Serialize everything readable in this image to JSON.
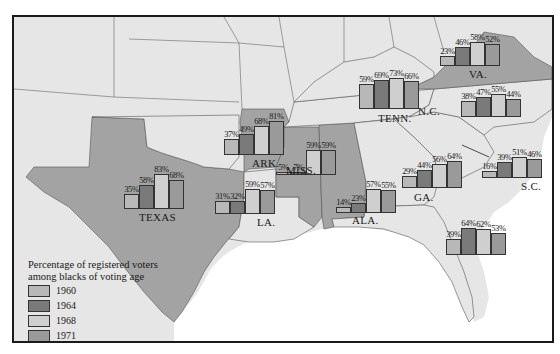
{
  "colors": {
    "y1960": "#b8b8b8",
    "y1964": "#7a7a7a",
    "y1968": "#cfcfcf",
    "y1971": "#9a9a9a",
    "poll_tax_state": "#a3a3a3",
    "other_state": "#e6e6e6",
    "water": "#ffffff"
  },
  "legend": {
    "title_line1": "Percentage of registered voters",
    "title_line2": "among blacks of voting age",
    "items": [
      {
        "label": "1960",
        "key": "y1960"
      },
      {
        "label": "1964",
        "key": "y1964"
      },
      {
        "label": "1968",
        "key": "y1968"
      },
      {
        "label": "1971",
        "key": "y1971"
      },
      {
        "label": "States using local poll tax to discriminate against black voters until 1965",
        "key": "poll_tax_state"
      }
    ]
  },
  "chart_data": {
    "type": "bar",
    "title": "Percentage of registered voters among blacks of voting age",
    "series_names": [
      "1960",
      "1964",
      "1968",
      "1971"
    ],
    "states": [
      {
        "name": "TEXAS",
        "values": [
          35,
          58,
          83,
          68
        ],
        "poll_tax": true
      },
      {
        "name": "ARK.",
        "values": [
          37,
          49,
          68,
          81
        ],
        "poll_tax": true
      },
      {
        "name": "LA.",
        "values": [
          31,
          32,
          59,
          57
        ],
        "poll_tax": false
      },
      {
        "name": "MISS.",
        "values": [
          5,
          7,
          59,
          59
        ],
        "poll_tax": true
      },
      {
        "name": "ALA.",
        "values": [
          14,
          23,
          57,
          55
        ],
        "poll_tax": true
      },
      {
        "name": "TENN.",
        "values": [
          59,
          69,
          73,
          66
        ],
        "poll_tax": false
      },
      {
        "name": "GA.",
        "values": [
          29,
          44,
          56,
          64
        ],
        "poll_tax": false
      },
      {
        "name": "S.C.",
        "values": [
          16,
          39,
          51,
          46
        ],
        "poll_tax": false
      },
      {
        "name": "N.C.",
        "values": [
          38,
          47,
          55,
          44
        ],
        "poll_tax": false
      },
      {
        "name": "VA.",
        "values": [
          23,
          46,
          58,
          52
        ],
        "poll_tax": true
      },
      {
        "name": "FLA.",
        "values": [
          39,
          64,
          62,
          53
        ],
        "poll_tax": false
      }
    ],
    "ylim": [
      0,
      100
    ],
    "legend_position": "bottom-left"
  },
  "layout": {
    "bar_width": 15,
    "px_per_pct": 0.42,
    "groups": [
      {
        "state": "TEXAS",
        "x": 110,
        "base_y": 192,
        "label_x": 125,
        "label_y": 194
      },
      {
        "state": "ARK.",
        "x": 210,
        "base_y": 138,
        "label_x": 238,
        "label_y": 140
      },
      {
        "state": "LA.",
        "x": 201,
        "base_y": 197,
        "label_x": 243,
        "label_y": 199
      },
      {
        "state": "MISS.",
        "x": 262,
        "base_y": 158,
        "label_x": 272,
        "label_y": 147
      },
      {
        "state": "ALA.",
        "x": 322,
        "base_y": 196,
        "label_x": 338,
        "label_y": 197
      },
      {
        "state": "TENN.",
        "x": 345,
        "base_y": 92,
        "label_x": 364,
        "label_y": 95
      },
      {
        "state": "GA.",
        "x": 388,
        "base_y": 171,
        "label_x": 400,
        "label_y": 174
      },
      {
        "state": "S.C.",
        "x": 468,
        "base_y": 161,
        "label_x": 507,
        "label_y": 163
      },
      {
        "state": "N.C.",
        "x": 447,
        "base_y": 100,
        "label_x": 404,
        "label_y": 88
      },
      {
        "state": "VA.",
        "x": 426,
        "base_y": 49,
        "label_x": 455,
        "label_y": 51
      },
      {
        "state": "FLA.",
        "x": 432,
        "base_y": 238,
        "label_x": 0,
        "label_y": -100
      }
    ]
  }
}
